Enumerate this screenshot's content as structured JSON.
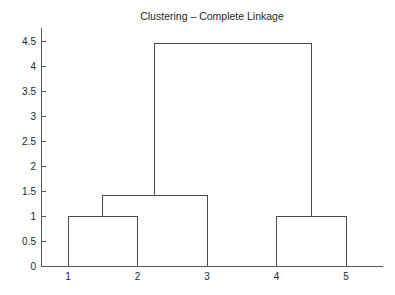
{
  "colors": {
    "background": "#ffffff",
    "dendrogram_line": "#4d4d4d",
    "axis_line": "#595959",
    "tick_line": "#595959",
    "text": "#262626"
  },
  "chart_data": {
    "type": "dendrogram",
    "title": "Clustering – Complete Linkage",
    "xlabel": "",
    "ylabel": "",
    "grid": false,
    "legend": null,
    "leaves": [
      "1",
      "2",
      "3",
      "4",
      "5"
    ],
    "merges": [
      {
        "clusters": [
          "1",
          "2"
        ],
        "height": 1.0
      },
      {
        "clusters": [
          "(1,2)",
          "3"
        ],
        "height": 1.42
      },
      {
        "clusters": [
          "4",
          "5"
        ],
        "height": 1.0
      },
      {
        "clusters": [
          "(1,2,3)",
          "(4,5)"
        ],
        "height": 4.46
      }
    ],
    "segments": [
      [
        [
          1,
          0
        ],
        [
          1,
          1.0
        ]
      ],
      [
        [
          2,
          0
        ],
        [
          2,
          1.0
        ]
      ],
      [
        [
          1,
          1.0
        ],
        [
          2,
          1.0
        ]
      ],
      [
        [
          1.5,
          1.0
        ],
        [
          1.5,
          1.42
        ]
      ],
      [
        [
          3,
          0
        ],
        [
          3,
          1.42
        ]
      ],
      [
        [
          1.5,
          1.42
        ],
        [
          3,
          1.42
        ]
      ],
      [
        [
          2.25,
          1.42
        ],
        [
          2.25,
          4.46
        ]
      ],
      [
        [
          4,
          0
        ],
        [
          4,
          1.0
        ]
      ],
      [
        [
          5,
          0
        ],
        [
          5,
          1.0
        ]
      ],
      [
        [
          4,
          1.0
        ],
        [
          5,
          1.0
        ]
      ],
      [
        [
          4.5,
          1.0
        ],
        [
          4.5,
          4.46
        ]
      ],
      [
        [
          2.25,
          4.46
        ],
        [
          4.5,
          4.46
        ]
      ]
    ],
    "xticks": [
      1,
      2,
      3,
      4,
      5
    ],
    "xticklabels": [
      "1",
      "2",
      "3",
      "4",
      "5"
    ],
    "yticks": [
      0,
      0.5,
      1,
      1.5,
      2,
      2.5,
      3,
      3.5,
      4,
      4.5
    ],
    "yticklabels": [
      "0",
      "0.5",
      "1",
      "1.5",
      "2",
      "2.5",
      "3",
      "3.5",
      "4",
      "4.5"
    ],
    "ylim": [
      0,
      4.76
    ],
    "box": false
  }
}
